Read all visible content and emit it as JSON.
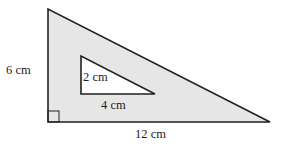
{
  "diagram": {
    "type": "geometry-figure",
    "colors": {
      "shaded_fill": "#e6e6e6",
      "hole_fill": "#ffffff",
      "stroke": "#222222"
    },
    "outer_triangle": {
      "height_label": "6 cm",
      "base_label": "12 cm",
      "right_angle_marker": true
    },
    "inner_triangle": {
      "height_label": "2 cm",
      "base_label": "4 cm"
    }
  }
}
